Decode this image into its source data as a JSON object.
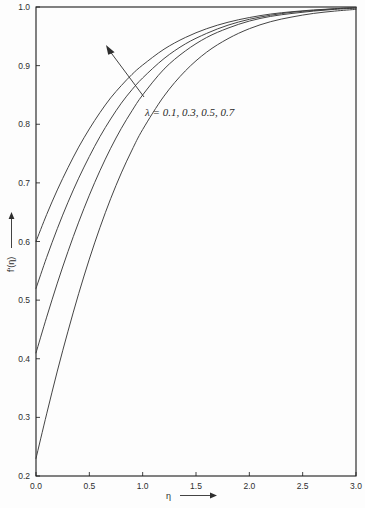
{
  "chart_data": {
    "type": "line",
    "title": "",
    "xlabel": "η",
    "ylabel": "f'(η)",
    "xlim": [
      0.0,
      3.0
    ],
    "ylim": [
      0.2,
      1.0
    ],
    "xticks": [
      "0.0",
      "0.5",
      "1.0",
      "1.5",
      "2.0",
      "2.5",
      "3.0"
    ],
    "yticks": [
      "0.2",
      "0.3",
      "0.4",
      "0.5",
      "0.6",
      "0.7",
      "0.8",
      "0.9",
      "1.0"
    ],
    "xtick_values": [
      0.0,
      0.5,
      1.0,
      1.5,
      2.0,
      2.5,
      3.0
    ],
    "ytick_values": [
      0.2,
      0.3,
      0.4,
      0.5,
      0.6,
      0.7,
      0.8,
      0.9,
      1.0
    ],
    "grid": false,
    "legend": "none",
    "annotation": "λ = 0.1, 0.3, 0.5, 0.7",
    "annotation_note": "arrow points up-left across curves, direction of increasing λ",
    "x": [
      0.0,
      0.1,
      0.2,
      0.3,
      0.4,
      0.5,
      0.6,
      0.7,
      0.8,
      0.9,
      1.0,
      1.2,
      1.4,
      1.6,
      1.8,
      2.0,
      2.2,
      2.4,
      2.6,
      2.8,
      3.0
    ],
    "series": [
      {
        "name": "λ = 0.7",
        "lambda": 0.7,
        "values": [
          0.6,
          0.646,
          0.688,
          0.726,
          0.761,
          0.792,
          0.82,
          0.845,
          0.866,
          0.885,
          0.901,
          0.928,
          0.948,
          0.963,
          0.974,
          0.982,
          0.988,
          0.992,
          0.995,
          0.997,
          0.999
        ]
      },
      {
        "name": "λ = 0.5",
        "lambda": 0.5,
        "values": [
          0.52,
          0.573,
          0.622,
          0.667,
          0.708,
          0.745,
          0.779,
          0.809,
          0.836,
          0.859,
          0.879,
          0.912,
          0.937,
          0.955,
          0.969,
          0.979,
          0.986,
          0.991,
          0.994,
          0.997,
          0.999
        ]
      },
      {
        "name": "λ = 0.3",
        "lambda": 0.3,
        "values": [
          0.41,
          0.471,
          0.529,
          0.583,
          0.633,
          0.679,
          0.721,
          0.759,
          0.793,
          0.823,
          0.85,
          0.894,
          0.925,
          0.948,
          0.964,
          0.976,
          0.984,
          0.989,
          0.993,
          0.996,
          0.998
        ]
      },
      {
        "name": "λ = 0.1",
        "lambda": 0.1,
        "values": [
          0.23,
          0.306,
          0.379,
          0.447,
          0.511,
          0.57,
          0.624,
          0.673,
          0.717,
          0.756,
          0.791,
          0.848,
          0.891,
          0.923,
          0.946,
          0.963,
          0.975,
          0.983,
          0.989,
          0.993,
          0.996
        ]
      }
    ],
    "colors": {
      "line": "#3a3a3a",
      "frame": "#1c1c1c",
      "text": "#2e2e2e",
      "background": "#fdfdfd"
    }
  }
}
